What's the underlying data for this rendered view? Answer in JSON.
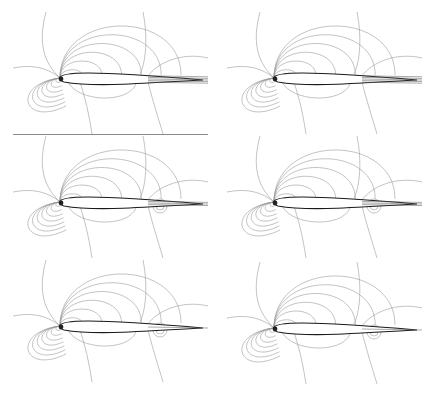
{
  "figure": {
    "caption_fragment": "",
    "layout": {
      "rows": 3,
      "columns": 2
    },
    "panels": [
      {
        "id": "row1-left",
        "wake": "thick",
        "has_rear_bubble": false
      },
      {
        "id": "row1-right",
        "wake": "thick",
        "has_rear_bubble": false
      },
      {
        "id": "row2-left",
        "wake": "medium",
        "has_rear_bubble": true
      },
      {
        "id": "row2-right",
        "wake": "medium",
        "has_rear_bubble": true
      },
      {
        "id": "row3-left",
        "wake": "thin",
        "has_rear_bubble": true
      },
      {
        "id": "row3-right",
        "wake": "thin",
        "has_rear_bubble": true
      }
    ],
    "colors": {
      "contour": "#9a9a9a",
      "airfoil": "#1a1a1a",
      "separator": "#8a8a8a"
    }
  }
}
